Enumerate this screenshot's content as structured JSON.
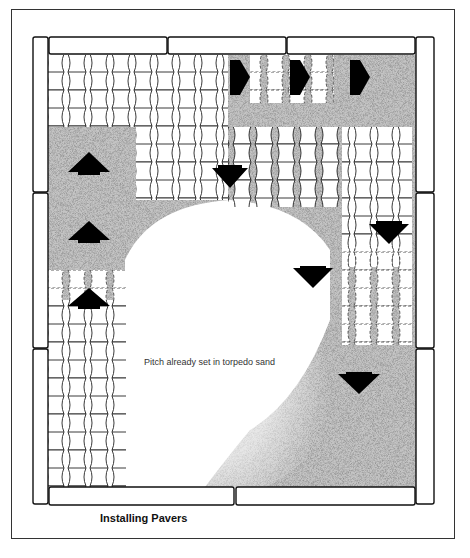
{
  "figure": {
    "caption": "Installing Pavers",
    "annotation": "Pitch already set in torpedo sand",
    "colors": {
      "line": "#111111",
      "sand": "#9a9a9a",
      "paver": "#ffffff",
      "arrow": "#000000",
      "background": "#ffffff"
    },
    "arrows": [
      {
        "direction": "right",
        "x": 240,
        "y": 77
      },
      {
        "direction": "right",
        "x": 300,
        "y": 77
      },
      {
        "direction": "right",
        "x": 360,
        "y": 77
      },
      {
        "direction": "up",
        "x": 89,
        "y": 163
      },
      {
        "direction": "up",
        "x": 89,
        "y": 232
      },
      {
        "direction": "up",
        "x": 89,
        "y": 298
      },
      {
        "direction": "down",
        "x": 230,
        "y": 177
      },
      {
        "direction": "down",
        "x": 389,
        "y": 233
      },
      {
        "direction": "down",
        "x": 313,
        "y": 277
      },
      {
        "direction": "down",
        "x": 359,
        "y": 383
      }
    ],
    "regions": [
      "edge-restraint-border",
      "laid-pavers",
      "dashed-paver-outlines",
      "torpedo-sand-bed",
      "unscreeded-area"
    ]
  }
}
